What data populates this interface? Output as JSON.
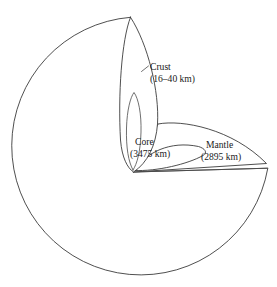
{
  "figure": {
    "background_color": "#ffffff",
    "line_color": "#3b3b3b"
  },
  "labels": {
    "crust": {
      "name": "Crust",
      "depth": "(16–40 km)"
    },
    "core": {
      "name": "Core",
      "depth": "(3475 km)"
    },
    "mantle": {
      "name": "Mantle",
      "depth": "(2895 km)"
    }
  },
  "geometry": {
    "circle_center_x": 139,
    "circle_center_y": 146,
    "circle_radius": 129
  }
}
